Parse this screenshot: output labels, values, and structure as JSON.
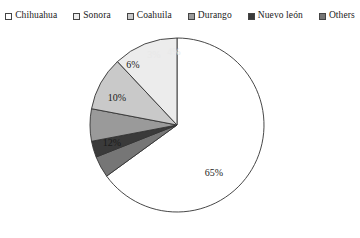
{
  "legend": {
    "items": [
      {
        "label": "Chihuahua",
        "color": "#ffffff",
        "swatch_name": "legend-swatch-chihuahua"
      },
      {
        "label": "Sonora",
        "color": "#ececec",
        "swatch_name": "legend-swatch-sonora"
      },
      {
        "label": "Coahuila",
        "color": "#c9c9c9",
        "swatch_name": "legend-swatch-coahuila"
      },
      {
        "label": "Durango",
        "color": "#9a9a9a",
        "swatch_name": "legend-swatch-durango"
      },
      {
        "label": "Nuevo león",
        "color": "#3a3a3a",
        "swatch_name": "legend-swatch-nuevo-leon"
      },
      {
        "label": "Others",
        "color": "#767676",
        "swatch_name": "legend-swatch-others"
      }
    ]
  },
  "chart_data": {
    "type": "pie",
    "title": "",
    "legend_position": "top",
    "start_angle_deg": 0,
    "direction": "clockwise",
    "labels": [
      "Chihuahua",
      "Sonora",
      "Coahuila",
      "Durango",
      "Nuevo león",
      "Others"
    ],
    "values": [
      65,
      12,
      10,
      6,
      3,
      4
    ],
    "value_labels": [
      "65%",
      "12%",
      "10%",
      "6%",
      "3%",
      "4%"
    ],
    "colors": [
      "#ffffff",
      "#ececec",
      "#c9c9c9",
      "#9a9a9a",
      "#3a3a3a",
      "#767676"
    ],
    "slice_order_clockwise_from_top": [
      "Chihuahua",
      "Others",
      "Nuevo león",
      "Durango",
      "Coahuila",
      "Sonora"
    ],
    "stroke_color": "#333333",
    "units": "percent",
    "total": 100
  },
  "slices": [
    {
      "name": "slice-chihuahua",
      "pct": "65%",
      "color": "#ffffff",
      "label_x": 214,
      "label_y": 150,
      "label_light": false
    },
    {
      "name": "slice-others",
      "pct": "4%",
      "color": "#767676",
      "label_x": 174,
      "label_y": 29,
      "label_light": true
    },
    {
      "name": "slice-nuevo-leon",
      "pct": "3%",
      "color": "#3a3a3a",
      "label_x": 154,
      "label_y": 32,
      "label_light": true
    },
    {
      "name": "slice-durango",
      "pct": "6%",
      "color": "#9a9a9a",
      "label_x": 133,
      "label_y": 42,
      "label_light": false
    },
    {
      "name": "slice-coahuila",
      "pct": "10%",
      "color": "#c9c9c9",
      "label_x": 117,
      "label_y": 75,
      "label_light": false
    },
    {
      "name": "slice-sonora",
      "pct": "12%",
      "color": "#ececec",
      "label_x": 112,
      "label_y": 120,
      "label_light": false
    }
  ]
}
